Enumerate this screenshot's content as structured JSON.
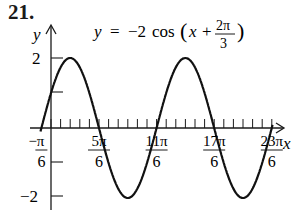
{
  "problem_number": "21.",
  "chart_data": {
    "type": "line",
    "equation": {
      "lhs": "y",
      "coef": "−2",
      "func": "cos",
      "arg_var": "x",
      "shift_num": "2π",
      "shift_den": "3"
    },
    "xlabel": "x",
    "ylabel": "y",
    "amplitude": 2,
    "period": "2π",
    "phase_shift": "−2π/3",
    "xlim": [
      "−π/6",
      "23π/6"
    ],
    "ylim": [
      -2,
      2
    ],
    "x_ticks": [
      {
        "num": "−π",
        "den": "6",
        "value": -0.5236
      },
      {
        "num": "5π",
        "den": "6",
        "value": 2.618
      },
      {
        "num": "11π",
        "den": "6",
        "value": 5.7596
      },
      {
        "num": "17π",
        "den": "6",
        "value": 8.9012
      },
      {
        "num": "23π",
        "den": "6",
        "value": 12.0428
      }
    ],
    "minor_tick_step": "π/6",
    "y_ticks": [
      {
        "label": "2",
        "value": 2
      },
      {
        "label": "",
        "value": 1
      },
      {
        "label": "",
        "value": -1
      },
      {
        "label": "−2",
        "value": -2
      }
    ],
    "points": [
      {
        "x": "−π/6",
        "y": 0
      },
      {
        "x": "π/3",
        "y": 2
      },
      {
        "x": "5π/6",
        "y": 0
      },
      {
        "x": "4π/3",
        "y": -2
      },
      {
        "x": "11π/6",
        "y": 0
      },
      {
        "x": "7π/3",
        "y": 2
      },
      {
        "x": "17π/6",
        "y": 0
      },
      {
        "x": "10π/3",
        "y": -2
      },
      {
        "x": "23π/6",
        "y": 0
      }
    ],
    "grid": false,
    "legend": null
  }
}
